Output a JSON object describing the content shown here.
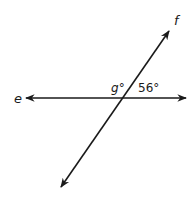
{
  "diagram": {
    "type": "intersecting-lines",
    "lines": [
      {
        "name": "e",
        "label": "e",
        "orientation": "horizontal"
      },
      {
        "name": "f",
        "label": "f",
        "orientation": "diagonal"
      }
    ],
    "angles": [
      {
        "variable": "g",
        "label": "g°",
        "position": "upper-left"
      },
      {
        "value": 56,
        "label": "56°",
        "position": "upper-right"
      }
    ],
    "colors": {
      "stroke": "#1a1a1a",
      "background": "#ffffff"
    }
  }
}
